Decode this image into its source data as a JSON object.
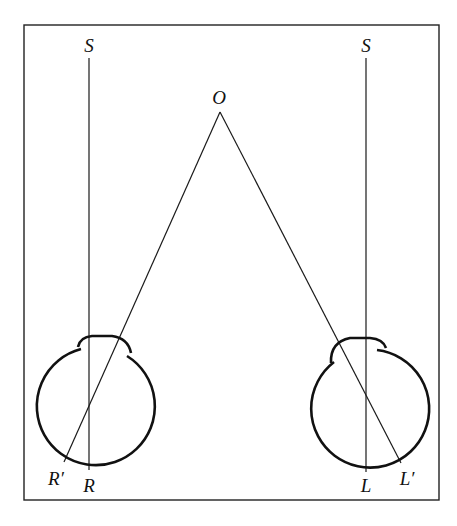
{
  "diagram": {
    "type": "binocular-vision-geometry",
    "labels": {
      "left_source": "S",
      "right_source": "S",
      "object": "O",
      "right_eye_fovea": "R",
      "right_eye_image": "R′",
      "left_eye_fovea": "L",
      "left_eye_image": "L′"
    },
    "colors": {
      "background": "#ffffff",
      "stroke": "#111111"
    }
  }
}
